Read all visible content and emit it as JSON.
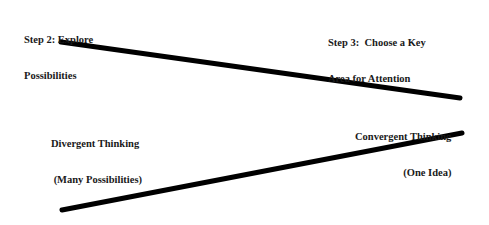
{
  "diagram": {
    "labels": {
      "step2_line1": "Step 2: Explore",
      "step2_line2": "Possibilities",
      "step3_line1": "Step 3:  Choose a Key",
      "step3_line2": "Area for Attention",
      "divergent_line1": "Divergent Thinking",
      "divergent_line2": " (Many Possibilities)",
      "convergent_line1": "Convergent Thinking",
      "convergent_line2": "(One Idea)"
    },
    "lines": [
      {
        "name": "upper-funnel-line",
        "x1": 61,
        "y1": 42,
        "x2": 460,
        "y2": 98
      },
      {
        "name": "lower-funnel-line",
        "x1": 62,
        "y1": 210,
        "x2": 462,
        "y2": 133
      }
    ],
    "colors": {
      "line": "#000000",
      "text": "#1a1a1a",
      "background": "#ffffff"
    }
  }
}
